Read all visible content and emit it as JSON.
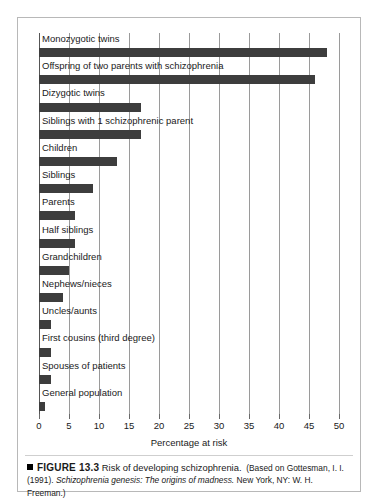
{
  "figure": {
    "marker": "black-square",
    "number_label": "FIGURE 13.3",
    "title": "Risk of developing schizophrenia.",
    "source_lead": "(Based on",
    "source_line1": "Gottesman, I. I. (1991).",
    "source_italic": "Schizophrenia genesis: The origins of madness.",
    "source_line2": "New",
    "source_line3": "York, NY: W. H. Freeman.)"
  },
  "axis": {
    "x_title": "Percentage at risk",
    "tick_labels": [
      "0",
      "5",
      "10",
      "15",
      "20",
      "25",
      "30",
      "35",
      "40",
      "45",
      "50"
    ]
  },
  "colors": {
    "bar": "#3d3d3d",
    "gridline": "#9a9a9a",
    "frame": "#b8b8b8",
    "text": "#1a1a1a"
  },
  "chart_data": {
    "type": "bar",
    "orientation": "horizontal",
    "title": "Risk of developing schizophrenia",
    "xlabel": "Percentage at risk",
    "ylabel": "",
    "xlim": [
      0,
      50
    ],
    "xticks": [
      0,
      5,
      10,
      15,
      20,
      25,
      30,
      35,
      40,
      45,
      50
    ],
    "grid": true,
    "legend": false,
    "categories": [
      "Monozygotic twins",
      "Offspring of two parents with schizophrenia",
      "Dizygotic twins",
      "Siblings with 1 schizophrenic parent",
      "Children",
      "Siblings",
      "Parents",
      "Half siblings",
      "Grandchildren",
      "Nephews/nieces",
      "Uncles/aunts",
      "First cousins (third degree)",
      "Spouses of patients",
      "General population"
    ],
    "values": [
      48,
      46,
      17,
      17,
      13,
      9,
      6,
      6,
      5,
      4,
      2,
      2,
      2,
      1
    ]
  }
}
